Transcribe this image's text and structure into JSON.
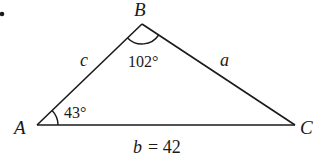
{
  "diagram": {
    "bullet": "•",
    "vertices": {
      "A": {
        "label": "A",
        "x": 37,
        "y": 125
      },
      "B": {
        "label": "B",
        "x": 142,
        "y": 24
      },
      "C": {
        "label": "C",
        "x": 295,
        "y": 125
      }
    },
    "sides": {
      "a": {
        "label": "a"
      },
      "b": {
        "label": "b",
        "value_text": "= 42"
      },
      "c": {
        "label": "c"
      }
    },
    "angles": {
      "A": {
        "text": "43°"
      },
      "B": {
        "text": "102°"
      }
    },
    "colors": {
      "stroke": "#1a1a1a",
      "background": "#ffffff"
    }
  }
}
